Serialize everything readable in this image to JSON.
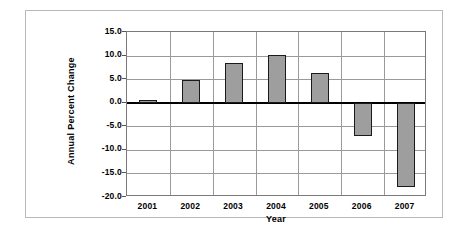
{
  "chart_data": {
    "type": "bar",
    "title": "",
    "xlabel": "Year",
    "ylabel": "Annual Percent Change",
    "categories": [
      "2001",
      "2002",
      "2003",
      "2004",
      "2005",
      "2006",
      "2007"
    ],
    "values": [
      0.4,
      4.9,
      8.4,
      10.1,
      6.3,
      -7.1,
      -17.9
    ],
    "ylim": [
      -20.0,
      15.0
    ],
    "ytick_labels": [
      "15.0",
      "10.0",
      "5.0",
      "0.0",
      "-5.0",
      "-10.0",
      "-15.0",
      "-20.0"
    ],
    "ytick_values": [
      15.0,
      10.0,
      5.0,
      0.0,
      -5.0,
      -10.0,
      -15.0,
      -20.0
    ],
    "grid": true,
    "legend": "none",
    "bar_fill_color": "#9e9e9e",
    "bar_border_color": "#1a1a1a",
    "gridline_color": "#9a9a9a",
    "zero_line_color": "#000000",
    "plot_border_color": "#7a7a7a",
    "outer_frame_color": "#b8b8b8"
  }
}
